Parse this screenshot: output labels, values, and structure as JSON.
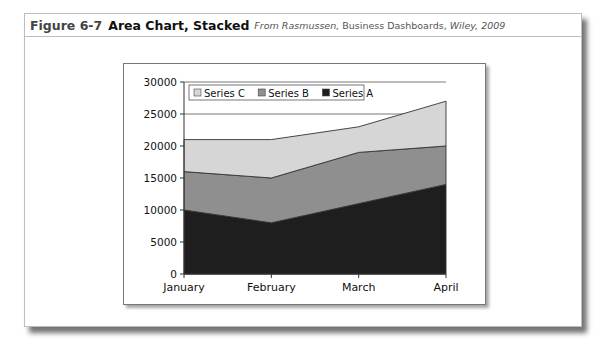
{
  "figure": {
    "number": "Figure 6-7",
    "title": "Area Chart, Stacked",
    "source_prefix": "From Rasmussen,",
    "source_book": "Business Dashboards,",
    "source_publisher": "Wiley, 2009"
  },
  "legend": {
    "items": [
      {
        "label": "Series C",
        "color": "#d6d6d6"
      },
      {
        "label": "Series B",
        "color": "#8f8f8f"
      },
      {
        "label": "Series A",
        "color": "#1e1e1e"
      }
    ]
  },
  "axes": {
    "y_ticks": [
      "30000",
      "25000",
      "20000",
      "15000",
      "10000",
      "5000",
      "0"
    ],
    "x_ticks": [
      "January",
      "February",
      "March",
      "April"
    ]
  },
  "chart_data": {
    "type": "area",
    "stacked": true,
    "title": "Area Chart, Stacked",
    "xlabel": "",
    "ylabel": "",
    "categories": [
      "January",
      "February",
      "March",
      "April"
    ],
    "series": [
      {
        "name": "Series A",
        "values": [
          10000,
          8000,
          11000,
          14000
        ],
        "color": "#1e1e1e"
      },
      {
        "name": "Series B",
        "values": [
          6000,
          7000,
          8000,
          6000
        ],
        "color": "#8f8f8f"
      },
      {
        "name": "Series C",
        "values": [
          5000,
          6000,
          4000,
          7000
        ],
        "color": "#d6d6d6"
      }
    ],
    "ylim": [
      0,
      30000
    ],
    "y_tick_step": 5000,
    "grid": "horizontal major gridlines",
    "legend_position": "top-left inside plot"
  }
}
